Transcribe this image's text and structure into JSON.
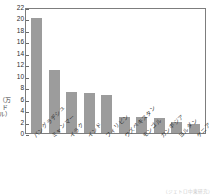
{
  "chart_data": {
    "type": "bar",
    "title": "",
    "subtitle": "",
    "xlabel": "",
    "ylabel": "（万ドル）",
    "ylim": [
      0,
      22
    ],
    "ytick_step": 2,
    "yticks": [
      "22",
      "20",
      "18",
      "16",
      "14",
      "12",
      "10",
      "8",
      "6",
      "4",
      "2",
      "0"
    ],
    "grid": false,
    "legend": null,
    "legend_position": "none",
    "bar_color": "#9c9c9c",
    "axis_color": "#7d7d7d",
    "categories": [
      "バングラデシュ",
      "ミャンマー",
      "イラク",
      "インド",
      "フィリピン",
      "ウズベキスタン",
      "モンゴル",
      "カンボジア",
      "ヨルダン",
      "ケニア"
    ],
    "values": [
      20.1,
      11.0,
      7.1,
      7.0,
      6.6,
      2.8,
      2.75,
      2.7,
      1.9,
      1.5
    ]
  },
  "caption": {
    "source": "（ジェトロ中東研究）"
  }
}
